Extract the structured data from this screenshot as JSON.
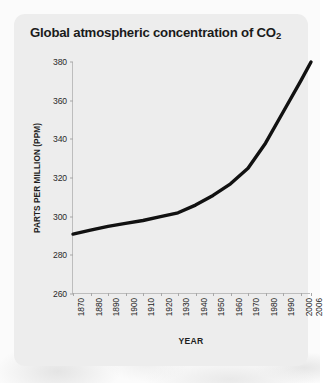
{
  "card": {
    "title_main": "Global atmospheric concentration of CO",
    "title_sub": "2",
    "background_color": "#ededed"
  },
  "chart_data": {
    "type": "line",
    "title": "Global atmospheric concentration of CO2",
    "xlabel": "YEAR",
    "ylabel": "PARTS PER MILLION (PPM)",
    "xlim": [
      1870,
      2006
    ],
    "ylim": [
      260,
      380
    ],
    "grid": false,
    "legend": null,
    "line_color": "#111111",
    "line_width_px": 3.4,
    "y_ticks": [
      260,
      280,
      300,
      320,
      340,
      360,
      380
    ],
    "x_ticks": [
      1870,
      1880,
      1890,
      1900,
      1910,
      1920,
      1930,
      1940,
      1950,
      1960,
      1970,
      1980,
      1990,
      2000,
      2006
    ],
    "x": [
      1870,
      1880,
      1890,
      1900,
      1910,
      1920,
      1930,
      1940,
      1950,
      1960,
      1970,
      1980,
      1990,
      2000,
      2006
    ],
    "values": [
      291,
      293,
      295,
      296.5,
      298,
      300,
      302,
      306,
      311,
      317,
      325,
      338,
      354,
      370,
      380
    ],
    "series": [
      {
        "name": "CO2 concentration",
        "values": [
          291,
          293,
          295,
          296.5,
          298,
          300,
          302,
          306,
          311,
          317,
          325,
          338,
          354,
          370,
          380
        ]
      }
    ]
  }
}
